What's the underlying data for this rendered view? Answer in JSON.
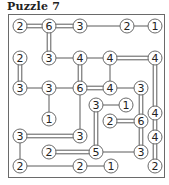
{
  "title": "Puzzle 7",
  "colors": {
    "line": "#5a5a5a",
    "node_border": "#6a6a6a",
    "text": "#222222"
  },
  "nodes": [
    {
      "id": "a",
      "x": 20,
      "y": 26,
      "v": "2"
    },
    {
      "id": "b",
      "x": 49,
      "y": 26,
      "v": "6"
    },
    {
      "id": "c",
      "x": 80,
      "y": 26,
      "v": "3"
    },
    {
      "id": "d",
      "x": 127,
      "y": 26,
      "v": "2"
    },
    {
      "id": "e",
      "x": 155,
      "y": 26,
      "v": "1"
    },
    {
      "id": "f",
      "x": 20,
      "y": 58,
      "v": "2"
    },
    {
      "id": "g",
      "x": 49,
      "y": 58,
      "v": "3"
    },
    {
      "id": "h",
      "x": 80,
      "y": 58,
      "v": "4"
    },
    {
      "id": "i",
      "x": 110,
      "y": 58,
      "v": "4"
    },
    {
      "id": "j",
      "x": 155,
      "y": 58,
      "v": "4"
    },
    {
      "id": "k",
      "x": 20,
      "y": 88,
      "v": "3"
    },
    {
      "id": "l",
      "x": 49,
      "y": 88,
      "v": "3"
    },
    {
      "id": "m",
      "x": 80,
      "y": 88,
      "v": "6"
    },
    {
      "id": "n",
      "x": 110,
      "y": 88,
      "v": "4"
    },
    {
      "id": "o",
      "x": 141,
      "y": 88,
      "v": "3"
    },
    {
      "id": "p",
      "x": 96,
      "y": 105,
      "v": "3"
    },
    {
      "id": "q",
      "x": 126,
      "y": 105,
      "v": "1"
    },
    {
      "id": "r",
      "x": 155,
      "y": 113,
      "v": "4"
    },
    {
      "id": "s",
      "x": 49,
      "y": 119,
      "v": "1"
    },
    {
      "id": "t",
      "x": 110,
      "y": 121,
      "v": "2"
    },
    {
      "id": "u",
      "x": 141,
      "y": 121,
      "v": "6"
    },
    {
      "id": "v",
      "x": 20,
      "y": 136,
      "v": "3"
    },
    {
      "id": "w",
      "x": 80,
      "y": 136,
      "v": "3"
    },
    {
      "id": "x",
      "x": 155,
      "y": 137,
      "v": "4"
    },
    {
      "id": "y",
      "x": 49,
      "y": 152,
      "v": "2"
    },
    {
      "id": "z",
      "x": 96,
      "y": 152,
      "v": "5"
    },
    {
      "id": "aa",
      "x": 141,
      "y": 152,
      "v": "3"
    },
    {
      "id": "ab",
      "x": 20,
      "y": 166,
      "v": "2"
    },
    {
      "id": "ac",
      "x": 80,
      "y": 166,
      "v": "2"
    },
    {
      "id": "ad",
      "x": 111,
      "y": 166,
      "v": "1"
    },
    {
      "id": "ae",
      "x": 155,
      "y": 166,
      "v": "2"
    }
  ],
  "bridges": [
    [
      "a",
      "b",
      2
    ],
    [
      "b",
      "c",
      2
    ],
    [
      "c",
      "d",
      1
    ],
    [
      "d",
      "e",
      1
    ],
    [
      "b",
      "g",
      2
    ],
    [
      "f",
      "k",
      2
    ],
    [
      "g",
      "h",
      1
    ],
    [
      "h",
      "i",
      1
    ],
    [
      "i",
      "j",
      2
    ],
    [
      "h",
      "m",
      2
    ],
    [
      "i",
      "n",
      1
    ],
    [
      "j",
      "r",
      2
    ],
    [
      "k",
      "l",
      1
    ],
    [
      "l",
      "m",
      1
    ],
    [
      "m",
      "n",
      2
    ],
    [
      "n",
      "o",
      1
    ],
    [
      "l",
      "s",
      1
    ],
    [
      "m",
      "w",
      1
    ],
    [
      "o",
      "u",
      2
    ],
    [
      "p",
      "q",
      1
    ],
    [
      "p",
      "z",
      2
    ],
    [
      "t",
      "u",
      2
    ],
    [
      "u",
      "aa",
      2
    ],
    [
      "r",
      "x",
      2
    ],
    [
      "x",
      "ae",
      2
    ],
    [
      "v",
      "w",
      2
    ],
    [
      "v",
      "ab",
      1
    ],
    [
      "y",
      "z",
      2
    ],
    [
      "z",
      "aa",
      1
    ],
    [
      "ab",
      "ac",
      1
    ],
    [
      "ac",
      "ad",
      1
    ]
  ]
}
